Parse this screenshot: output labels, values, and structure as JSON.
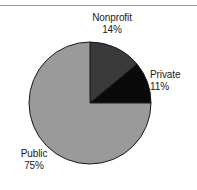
{
  "chart_data": {
    "type": "pie",
    "title": "",
    "categories": [
      "Nonprofit",
      "Private",
      "Public"
    ],
    "values": [
      14,
      11,
      75
    ],
    "value_unit": "%",
    "labels": [
      {
        "name": "Nonprofit",
        "value": "14%",
        "color": "#3a3a3a",
        "position": "top"
      },
      {
        "name": "Private",
        "value": "11%",
        "color": "#0a0a0a",
        "position": "right"
      },
      {
        "name": "Public",
        "value": "75%",
        "color": "#9a9a9a",
        "position": "bottom-left"
      }
    ],
    "start_angle_deg": 0,
    "direction": "clockwise",
    "legend": "none",
    "grid": false,
    "xlabel": "",
    "ylabel": ""
  },
  "figure": {
    "background_color": "#ffffff",
    "rule_color": "#9a9a9a",
    "pie_outline_color": "#1a1a1a",
    "text_color": "#1a1a1a"
  }
}
